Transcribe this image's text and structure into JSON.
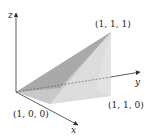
{
  "diagram": {
    "title": "",
    "axes": {
      "x": {
        "label": "x"
      },
      "y": {
        "label": "y"
      },
      "z": {
        "label": "z"
      }
    },
    "points": [
      {
        "id": "p111",
        "label": "(1, 1, 1)"
      },
      {
        "id": "p110",
        "label": "(1, 1, 0)"
      },
      {
        "id": "p100",
        "label": "(1, 0, 0)"
      }
    ],
    "colors": {
      "axis": "#333333",
      "face_dark": "#9a9a9a",
      "face_mid": "#c4c4c4",
      "face_light": "#dedede",
      "face_bottom": "#e8e8e8",
      "hidden_edge": "#555555"
    }
  }
}
